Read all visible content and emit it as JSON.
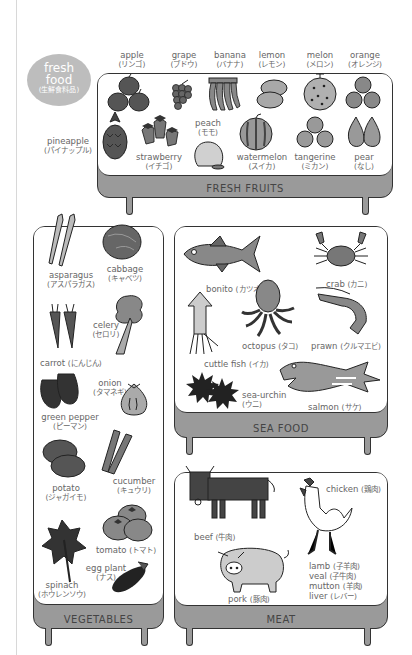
{
  "badge": {
    "line1": "fresh",
    "line2": "food",
    "line3": "(生鮮食料品)",
    "color": "#bdbdbd"
  },
  "boards": {
    "fruits": {
      "title": "FRESH FRUITS"
    },
    "vegetables": {
      "title": "VEGETABLES"
    },
    "seafood": {
      "title": "SEA FOOD"
    },
    "meat": {
      "title": "MEAT"
    }
  },
  "fruits": [
    {
      "en": "apple",
      "jp": "(リンゴ)"
    },
    {
      "en": "grape",
      "jp": "(ブドウ)"
    },
    {
      "en": "banana",
      "jp": "(バナナ)"
    },
    {
      "en": "lemon",
      "jp": "(レモン)"
    },
    {
      "en": "melon",
      "jp": "(メロン)"
    },
    {
      "en": "orange",
      "jp": "(オレンジ)"
    },
    {
      "en": "pineapple",
      "jp": "(パイナップル)"
    },
    {
      "en": "strawberry",
      "jp": "(イチゴ)"
    },
    {
      "en": "peach",
      "jp": "(モモ)"
    },
    {
      "en": "watermelon",
      "jp": "(スイカ)"
    },
    {
      "en": "tangerine",
      "jp": "(ミカン)"
    },
    {
      "en": "pear",
      "jp": "(なし)"
    }
  ],
  "vegetables": [
    {
      "en": "asparagus",
      "jp": "(アスパラガス)"
    },
    {
      "en": "cabbage",
      "jp": "(キャベツ)"
    },
    {
      "en": "celery",
      "jp": "(セロリ)"
    },
    {
      "en": "carrot",
      "jp": "(にんじん)"
    },
    {
      "en": "onion",
      "jp": "(タマネギ)"
    },
    {
      "en": "green pepper",
      "jp": "(ピーマン)"
    },
    {
      "en": "potato",
      "jp": "(ジャガイモ)"
    },
    {
      "en": "cucumber",
      "jp": "(キュウリ)"
    },
    {
      "en": "tomato",
      "jp": "(トマト)"
    },
    {
      "en": "egg plant",
      "jp": "(ナス)"
    },
    {
      "en": "spinach",
      "jp": "(ホウレンソウ)"
    }
  ],
  "seafood": [
    {
      "en": "bonito",
      "jp": "(カツオ)"
    },
    {
      "en": "crab",
      "jp": "(カニ)"
    },
    {
      "en": "octopus",
      "jp": "(タコ)"
    },
    {
      "en": "prawn",
      "jp": "(クルマエビ)"
    },
    {
      "en": "cuttle fish",
      "jp": "(イカ)"
    },
    {
      "en": "sea-urchin",
      "jp": "(ウニ)"
    },
    {
      "en": "salmon",
      "jp": "(サケ)"
    }
  ],
  "meat": [
    {
      "en": "beef",
      "jp": "(牛肉)"
    },
    {
      "en": "chicken",
      "jp": "(鶏肉)"
    },
    {
      "en": "pork",
      "jp": "(豚肉)"
    },
    {
      "en": "lamb",
      "jp": "(子羊肉)"
    },
    {
      "en": "veal",
      "jp": "(子牛肉)"
    },
    {
      "en": "mutton",
      "jp": "(羊肉)"
    },
    {
      "en": "liver",
      "jp": "(レバー)"
    }
  ]
}
